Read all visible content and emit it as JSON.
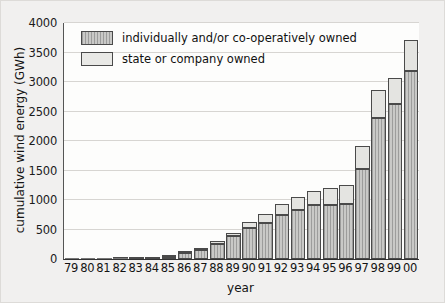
{
  "chart_data": {
    "type": "bar",
    "stacked": true,
    "title": "",
    "xlabel": "year",
    "ylabel": "cumulative wind energy (GWh)",
    "ylim": [
      0,
      4000
    ],
    "ytick_labels": [
      "0",
      "500",
      "1000",
      "1500",
      "2000",
      "2500",
      "3000",
      "3500",
      "4000"
    ],
    "ytick_values": [
      0,
      500,
      1000,
      1500,
      2000,
      2500,
      3000,
      3500,
      4000
    ],
    "grid": true,
    "legend_position": "upper-left-inside",
    "categories": [
      "79",
      "80",
      "81",
      "82",
      "83",
      "84",
      "85",
      "86",
      "87",
      "88",
      "89",
      "90",
      "91",
      "92",
      "93",
      "94",
      "95",
      "96",
      "97",
      "98",
      "99",
      "00"
    ],
    "series": [
      {
        "name": "individually and/or co-operatively owned",
        "fill": "hatched-gray",
        "values": [
          0,
          2,
          5,
          8,
          14,
          18,
          35,
          110,
          155,
          260,
          390,
          530,
          610,
          745,
          830,
          910,
          910,
          930,
          1525,
          2385,
          2635,
          3195
        ]
      },
      {
        "name": "state or company owned",
        "fill": "light-gray",
        "values": [
          0,
          1,
          2,
          3,
          4,
          5,
          10,
          20,
          25,
          40,
          50,
          90,
          150,
          195,
          225,
          250,
          300,
          320,
          385,
          475,
          435,
          525
        ]
      }
    ],
    "totals": [
      0,
      3,
      7,
      11,
      18,
      23,
      45,
      130,
      180,
      300,
      440,
      620,
      760,
      940,
      1055,
      1160,
      1210,
      1250,
      1910,
      2860,
      3070,
      3720
    ],
    "colors": {
      "lower_fill": "#c9c9c7",
      "upper_fill": "#e4e4e1",
      "bar_border": "#4a4a4a",
      "gridline": "#d7d5d2",
      "plot_background": "#fdfdfc",
      "page_background": "#f1f0ef",
      "text": "#141414"
    }
  },
  "legend": {
    "items": [
      {
        "label": "individually and/or co-operatively owned",
        "swatch": "hatched"
      },
      {
        "label": "state or company owned",
        "swatch": "plain"
      }
    ]
  },
  "axes": {
    "x_title": "year",
    "y_title": "cumulative wind energy (GWh)"
  }
}
